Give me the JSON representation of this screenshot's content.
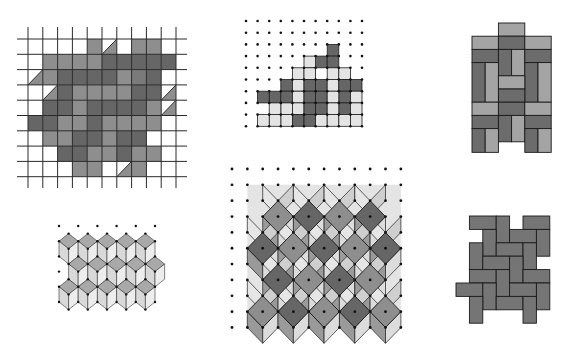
{
  "figure": {
    "panels": [
      {
        "id": "grid-skew-tiling",
        "label": "Square grid with parallelogram tiling"
      },
      {
        "id": "dot-grid-zigzag-tiling",
        "label": "Dot grid with zigzag polyomino tiling"
      },
      {
        "id": "basketweave-tiling",
        "label": "Basketweave rectangle tiling"
      },
      {
        "id": "tumbling-blocks-small",
        "label": "Triangular lattice tumbling blocks"
      },
      {
        "id": "tumbling-blocks-large",
        "label": "Square dot grid cube tiling"
      },
      {
        "id": "herringbone-tiling",
        "label": "Herringbone rectangle tiling"
      }
    ]
  },
  "colors": {
    "white": "#ffffff",
    "light": "#d6d6d6",
    "lighter": "#e4e4e4",
    "medium": "#8e8e8e",
    "medium_dark": "#7a7a7a",
    "dark": "#666666",
    "darker": "#555555",
    "line": "#1e1e1e",
    "dot": "#111111"
  },
  "grid_tiling": {
    "x0": 28,
    "dx": 14.8,
    "cols": 10,
    "y0": 39,
    "dy": 15.3,
    "rows": 9,
    "line_x_extent": [
      17,
      187
    ],
    "line_y_extent": [
      27,
      188
    ],
    "cells": [
      [
        null,
        null,
        null,
        null,
        "m",
        "tl",
        null,
        "m",
        "m",
        null
      ],
      [
        null,
        "m",
        "m",
        "m",
        "m",
        "d",
        "d",
        "d",
        "d",
        "d"
      ],
      [
        "tr",
        "m",
        "d",
        "d",
        "d",
        "d",
        "m",
        "md",
        "d",
        null
      ],
      [
        null,
        "tl",
        "d",
        "m",
        "m",
        "m",
        "m",
        "d",
        "d",
        "tr"
      ],
      [
        null,
        "d",
        "d",
        "m",
        "d",
        "d",
        "d",
        "d",
        "m",
        "tl"
      ],
      [
        "d",
        "d",
        "m",
        "m",
        "d",
        "m",
        "m",
        "m",
        "m",
        null
      ],
      [
        null,
        "m",
        "m",
        "d",
        "d",
        "m",
        "d",
        "d",
        null,
        null
      ],
      [
        null,
        null,
        "d",
        "d",
        "m",
        "m",
        "d",
        "m",
        "m",
        null
      ],
      [
        null,
        null,
        null,
        "m",
        "m",
        null,
        "tl",
        "m",
        null,
        null
      ]
    ]
  },
  "zigzag_tiling": {
    "x0": 246,
    "dx": 11.6,
    "cols": 11,
    "y0": 21,
    "dy": 11.7,
    "rows": 10,
    "tiles": [
      {
        "shade": "dark",
        "cells": [
          [
            7,
            2
          ],
          [
            6,
            3
          ],
          [
            7,
            3
          ],
          [
            5,
            4
          ]
        ]
      },
      {
        "shade": "light",
        "cells": [
          [
            5,
            3
          ],
          [
            4,
            4
          ],
          [
            5,
            4
          ]
        ]
      },
      {
        "shade": "dark",
        "cells": [
          [
            3,
            5
          ],
          [
            2,
            6
          ],
          [
            3,
            6
          ],
          [
            1,
            6
          ]
        ]
      },
      {
        "shade": "light",
        "cells": [
          [
            4,
            5
          ],
          [
            3,
            7
          ],
          [
            4,
            6
          ],
          [
            4,
            7
          ]
        ]
      },
      {
        "shade": "dark",
        "cells": [
          [
            5,
            5
          ],
          [
            6,
            5
          ],
          [
            5,
            6
          ],
          [
            6,
            6
          ]
        ]
      },
      {
        "shade": "light",
        "cells": [
          [
            7,
            4
          ],
          [
            8,
            4
          ],
          [
            7,
            5
          ]
        ]
      },
      {
        "shade": "dark",
        "cells": [
          [
            8,
            5
          ],
          [
            9,
            5
          ],
          [
            8,
            6
          ],
          [
            8,
            7
          ]
        ]
      },
      {
        "shade": "light",
        "cells": [
          [
            2,
            7
          ],
          [
            3,
            8
          ],
          [
            2,
            8
          ],
          [
            1,
            8
          ]
        ]
      },
      {
        "shade": "dark",
        "cells": [
          [
            4,
            8
          ],
          [
            5,
            7
          ],
          [
            6,
            7
          ],
          [
            5,
            8
          ]
        ]
      },
      {
        "shade": "light",
        "cells": [
          [
            7,
            6
          ],
          [
            7,
            7
          ],
          [
            6,
            8
          ],
          [
            7,
            8
          ]
        ]
      },
      {
        "shade": "light",
        "cells": [
          [
            9,
            6
          ],
          [
            9,
            7
          ],
          [
            8,
            8
          ],
          [
            9,
            8
          ]
        ]
      }
    ]
  },
  "basketweave": {
    "x0": 472,
    "y0": 23,
    "u": 13.2,
    "rects": [
      {
        "x": 2,
        "y": 0,
        "w": 2,
        "h": 1,
        "shade": "light"
      },
      {
        "x": 0,
        "y": 1,
        "w": 2,
        "h": 1,
        "shade": "light"
      },
      {
        "x": 2,
        "y": 1,
        "w": 2,
        "h": 1,
        "shade": "dark"
      },
      {
        "x": 4,
        "y": 1,
        "w": 2,
        "h": 1,
        "shade": "light"
      },
      {
        "x": 0,
        "y": 2,
        "w": 2,
        "h": 1,
        "shade": "dark"
      },
      {
        "x": 2,
        "y": 2,
        "w": 1,
        "h": 2,
        "shade": "dark"
      },
      {
        "x": 3,
        "y": 2,
        "w": 1,
        "h": 2,
        "shade": "light"
      },
      {
        "x": 4,
        "y": 2,
        "w": 2,
        "h": 1,
        "shade": "dark"
      },
      {
        "x": 0,
        "y": 3,
        "w": 1,
        "h": 3,
        "shade": "dark"
      },
      {
        "x": 1,
        "y": 3,
        "w": 1,
        "h": 3,
        "shade": "light"
      },
      {
        "x": 4,
        "y": 3,
        "w": 1,
        "h": 3,
        "shade": "dark"
      },
      {
        "x": 5,
        "y": 3,
        "w": 1,
        "h": 3,
        "shade": "light"
      },
      {
        "x": 2,
        "y": 4,
        "w": 2,
        "h": 1,
        "shade": "light"
      },
      {
        "x": 2,
        "y": 5,
        "w": 2,
        "h": 1,
        "shade": "dark"
      },
      {
        "x": 0,
        "y": 6,
        "w": 2,
        "h": 1,
        "shade": "light"
      },
      {
        "x": 2,
        "y": 6,
        "w": 2,
        "h": 1,
        "shade": "dark"
      },
      {
        "x": 4,
        "y": 6,
        "w": 2,
        "h": 1,
        "shade": "light"
      },
      {
        "x": 0,
        "y": 7,
        "w": 2,
        "h": 1,
        "shade": "dark"
      },
      {
        "x": 2,
        "y": 7,
        "w": 1,
        "h": 2,
        "shade": "dark"
      },
      {
        "x": 3,
        "y": 7,
        "w": 1,
        "h": 2,
        "shade": "light"
      },
      {
        "x": 4,
        "y": 7,
        "w": 2,
        "h": 1,
        "shade": "dark"
      },
      {
        "x": 0,
        "y": 8,
        "w": 1,
        "h": 1.8,
        "shade": "dark"
      },
      {
        "x": 1,
        "y": 8,
        "w": 1,
        "h": 1.8,
        "shade": "light"
      },
      {
        "x": 4,
        "y": 8,
        "w": 1,
        "h": 1.8,
        "shade": "dark"
      },
      {
        "x": 5,
        "y": 8,
        "w": 1,
        "h": 1.8,
        "shade": "light"
      }
    ]
  },
  "herringbone": {
    "x0": 456,
    "y0": 216,
    "u": 13.4,
    "bricks": [
      [
        1,
        0,
        2,
        1
      ],
      [
        3,
        0,
        1,
        2
      ],
      [
        5,
        0,
        2,
        1
      ],
      [
        2,
        1,
        1,
        2
      ],
      [
        4,
        1,
        2,
        1
      ],
      [
        6,
        1,
        1,
        2
      ],
      [
        1,
        2,
        1,
        2
      ],
      [
        3,
        2,
        2,
        1
      ],
      [
        5,
        2,
        1,
        2
      ],
      [
        2,
        3,
        2,
        1
      ],
      [
        4,
        3,
        1,
        2
      ],
      [
        1,
        4,
        2,
        1
      ],
      [
        3,
        4,
        1,
        2
      ],
      [
        5,
        4,
        2,
        1
      ],
      [
        0,
        5,
        2,
        1
      ],
      [
        2,
        5,
        1,
        2
      ],
      [
        4,
        5,
        2,
        1
      ],
      [
        6,
        5,
        1,
        2
      ],
      [
        1,
        6,
        1,
        2
      ],
      [
        3,
        6,
        2,
        1
      ],
      [
        5,
        6,
        1,
        2
      ]
    ]
  },
  "cube_tiling_large": {
    "x0": 232,
    "dx": 15.35,
    "cols": 12,
    "y0": 169,
    "dy": 15.85,
    "rows": 11,
    "diamond_rows": [
      {
        "row": 3,
        "cols": [
          3,
          5,
          7,
          9
        ],
        "shades": [
          "medium",
          "dark",
          "medium",
          "dark"
        ]
      },
      {
        "row": 5,
        "cols": [
          2,
          4,
          6,
          8,
          10
        ],
        "shades": [
          "dark",
          "medium",
          "dark",
          "medium",
          "dark"
        ]
      },
      {
        "row": 7,
        "cols": [
          3,
          5,
          7,
          9
        ],
        "shades": [
          "dark",
          "medium",
          "dark",
          "medium"
        ]
      },
      {
        "row": 9,
        "cols": [
          2,
          4,
          6,
          8,
          10
        ],
        "shades": [
          "medium",
          "dark",
          "medium",
          "dark",
          "medium"
        ]
      }
    ]
  },
  "cube_tiling_small": {
    "x0": 59,
    "dx": 9.6,
    "y0": 226,
    "dy": 7.6,
    "cols": 11,
    "rows": 12
  }
}
